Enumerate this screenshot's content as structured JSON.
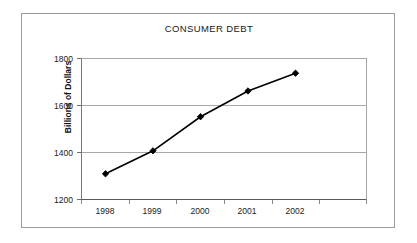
{
  "chart_data": {
    "type": "line",
    "title": "CONSUMER DEBT",
    "xlabel": "",
    "ylabel": "Billions of Dollars",
    "categories": [
      "1998",
      "1999",
      "2000",
      "2001",
      "2002"
    ],
    "values": [
      1315,
      1412,
      1556,
      1665,
      1740
    ],
    "series": [
      {
        "name": "Consumer Debt",
        "values": [
          1315,
          1412,
          1556,
          1665,
          1740
        ]
      }
    ],
    "ylim": [
      1200,
      1800
    ],
    "yticks": [
      "1200",
      "1400",
      "1600",
      "1800"
    ],
    "ytick_values": [
      1200,
      1400,
      1600,
      1800
    ],
    "grid": "horizontal",
    "legend": "none",
    "marker": "diamond",
    "line_color": "#000000",
    "marker_color": "#000000",
    "grid_color": "#a8a8a8",
    "plot_background": "#ffffff",
    "border_color": "#9a9a9a"
  }
}
